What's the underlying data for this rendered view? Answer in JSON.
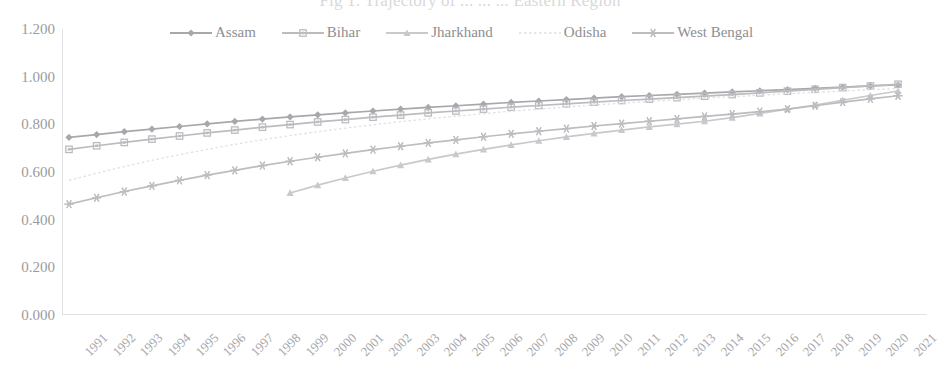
{
  "chart": {
    "title": "Fig 1.  Trajectory of ...  ...  ... Eastern Region",
    "legend_position": "top-center"
  },
  "axes": {
    "y_ticks": [
      "1.200",
      "1.000",
      "0.800",
      "0.600",
      "0.400",
      "0.200",
      "0.000"
    ],
    "x_ticks": [
      "1991",
      "1992",
      "1993",
      "1994",
      "1995",
      "1996",
      "1997",
      "1998",
      "1999",
      "2000",
      "2001",
      "2002",
      "2003",
      "2004",
      "2005",
      "2006",
      "2007",
      "2008",
      "2009",
      "2010",
      "2011",
      "2012",
      "2013",
      "2014",
      "2015",
      "2016",
      "2017",
      "2018",
      "2019",
      "2020",
      "2021"
    ]
  },
  "legend": [
    {
      "label": "Assam",
      "marker": "diamond",
      "color": "#a8a8ac"
    },
    {
      "label": "Bihar",
      "marker": "square",
      "color": "#bcbcc0"
    },
    {
      "label": "Jharkhand",
      "marker": "triangle",
      "color": "#c9c9cd"
    },
    {
      "label": "Odisha",
      "marker": "none",
      "color": "#e0e0e3"
    },
    {
      "label": "West Bengal",
      "marker": "asterisk",
      "color": "#bdbdc1"
    }
  ],
  "chart_data": {
    "type": "line",
    "title": "Fig 1.  Trajectory of ...  ...  ... Eastern Region",
    "xlabel": "",
    "ylabel": "",
    "ylim": [
      0.0,
      1.2
    ],
    "ytick_step": 0.2,
    "grid": false,
    "legend": "top-center",
    "x": [
      1991,
      1992,
      1993,
      1994,
      1995,
      1996,
      1997,
      1998,
      1999,
      2000,
      2001,
      2002,
      2003,
      2004,
      2005,
      2006,
      2007,
      2008,
      2009,
      2010,
      2011,
      2012,
      2013,
      2014,
      2015,
      2016,
      2017,
      2018,
      2019,
      2020,
      2021
    ],
    "series": [
      {
        "name": "Assam",
        "marker": "diamond",
        "color": "#a8a8ac",
        "x": [
          1991,
          1992,
          1993,
          1994,
          1995,
          1996,
          1997,
          1998,
          1999,
          2000,
          2001,
          2002,
          2003,
          2004,
          2005,
          2006,
          2007,
          2008,
          2009,
          2010,
          2011,
          2012,
          2013,
          2014,
          2015,
          2016,
          2017,
          2018,
          2019,
          2020,
          2021
        ],
        "values": [
          0.745,
          0.757,
          0.769,
          0.78,
          0.791,
          0.802,
          0.812,
          0.822,
          0.831,
          0.84,
          0.848,
          0.856,
          0.864,
          0.871,
          0.878,
          0.885,
          0.892,
          0.898,
          0.904,
          0.91,
          0.916,
          0.921,
          0.926,
          0.931,
          0.936,
          0.941,
          0.946,
          0.951,
          0.956,
          0.961,
          0.965
        ]
      },
      {
        "name": "Bihar",
        "marker": "square",
        "color": "#bcbcc0",
        "x": [
          1991,
          1992,
          1993,
          1994,
          1995,
          1996,
          1997,
          1998,
          1999,
          2000,
          2001,
          2002,
          2003,
          2004,
          2005,
          2006,
          2007,
          2008,
          2009,
          2010,
          2011,
          2012,
          2013,
          2014,
          2015,
          2016,
          2017,
          2018,
          2019,
          2020,
          2021
        ],
        "values": [
          0.695,
          0.71,
          0.724,
          0.738,
          0.751,
          0.764,
          0.776,
          0.788,
          0.799,
          0.81,
          0.82,
          0.83,
          0.839,
          0.848,
          0.856,
          0.864,
          0.872,
          0.879,
          0.886,
          0.893,
          0.9,
          0.906,
          0.912,
          0.918,
          0.925,
          0.932,
          0.939,
          0.947,
          0.954,
          0.961,
          0.968
        ]
      },
      {
        "name": "Jharkhand",
        "marker": "triangle",
        "color": "#c9c9cd",
        "x": [
          1999,
          2000,
          2001,
          2002,
          2003,
          2004,
          2005,
          2006,
          2007,
          2008,
          2009,
          2010,
          2011,
          2012,
          2013,
          2014,
          2015,
          2016,
          2017,
          2018,
          2019,
          2020,
          2021
        ],
        "values": [
          0.512,
          0.545,
          0.575,
          0.603,
          0.629,
          0.653,
          0.675,
          0.695,
          0.714,
          0.731,
          0.747,
          0.762,
          0.776,
          0.789,
          0.801,
          0.813,
          0.828,
          0.846,
          0.864,
          0.881,
          0.901,
          0.921,
          0.94
        ]
      },
      {
        "name": "Odisha",
        "marker": "none",
        "color": "#e0e0e3",
        "x": [
          1991,
          1992,
          1993,
          1994,
          1995,
          1996,
          1997,
          1998,
          1999,
          2000,
          2001,
          2002,
          2003,
          2004,
          2005,
          2006,
          2007,
          2008,
          2009,
          2010,
          2011,
          2012,
          2013,
          2014,
          2015,
          2016,
          2017,
          2018,
          2019,
          2020,
          2021
        ],
        "values": [
          0.565,
          0.595,
          0.623,
          0.649,
          0.673,
          0.695,
          0.716,
          0.735,
          0.753,
          0.769,
          0.784,
          0.798,
          0.811,
          0.823,
          0.834,
          0.845,
          0.855,
          0.864,
          0.873,
          0.881,
          0.889,
          0.896,
          0.903,
          0.91,
          0.916,
          0.922,
          0.928,
          0.934,
          0.94,
          0.945,
          0.95
        ]
      },
      {
        "name": "West Bengal",
        "marker": "asterisk",
        "color": "#bdbdc1",
        "x": [
          1991,
          1992,
          1993,
          1994,
          1995,
          1996,
          1997,
          1998,
          1999,
          2000,
          2001,
          2002,
          2003,
          2004,
          2005,
          2006,
          2007,
          2008,
          2009,
          2010,
          2011,
          2012,
          2013,
          2014,
          2015,
          2016,
          2017,
          2018,
          2019,
          2020,
          2021
        ],
        "values": [
          0.465,
          0.492,
          0.518,
          0.542,
          0.565,
          0.587,
          0.607,
          0.627,
          0.645,
          0.662,
          0.678,
          0.694,
          0.708,
          0.722,
          0.735,
          0.748,
          0.76,
          0.771,
          0.782,
          0.793,
          0.803,
          0.813,
          0.823,
          0.833,
          0.843,
          0.853,
          0.864,
          0.878,
          0.893,
          0.907,
          0.92
        ]
      }
    ]
  }
}
